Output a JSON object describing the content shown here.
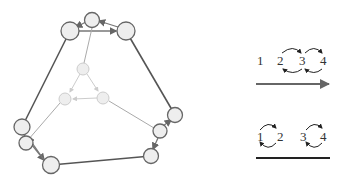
{
  "graph": {
    "description": "Truncated-tetrahedron-like graph with outer hexagon and inner faded triangle",
    "colors": {
      "outer_edge": "#555555",
      "inner_edge": "#aaaaaa",
      "faded_edge": "#cccccc",
      "node_fill": "#eeeeee",
      "node_stroke_outer": "#666666",
      "node_stroke_inner": "#cccccc"
    },
    "nodes": [
      {
        "id": "top",
        "x": 92,
        "y": 20,
        "r": 8,
        "layer": "outer"
      },
      {
        "id": "top-left",
        "x": 70,
        "y": 31,
        "r": 9,
        "layer": "outer"
      },
      {
        "id": "top-right",
        "x": 126,
        "y": 31,
        "r": 9,
        "layer": "outer"
      },
      {
        "id": "left",
        "x": 22,
        "y": 127,
        "r": 8,
        "layer": "outer"
      },
      {
        "id": "left-low",
        "x": 26,
        "y": 143,
        "r": 7,
        "layer": "outer"
      },
      {
        "id": "bottom-left",
        "x": 51,
        "y": 165,
        "r": 9,
        "layer": "outer"
      },
      {
        "id": "right",
        "x": 175,
        "y": 115,
        "r": 8,
        "layer": "outer"
      },
      {
        "id": "right-low",
        "x": 160,
        "y": 131,
        "r": 7,
        "layer": "outer"
      },
      {
        "id": "bottom-right",
        "x": 151,
        "y": 156,
        "r": 8,
        "layer": "outer"
      },
      {
        "id": "inner-top",
        "x": 83,
        "y": 69,
        "r": 6,
        "layer": "inner"
      },
      {
        "id": "inner-left",
        "x": 65,
        "y": 99,
        "r": 6,
        "layer": "inner"
      },
      {
        "id": "inner-right",
        "x": 103,
        "y": 98,
        "r": 6,
        "layer": "inner"
      }
    ]
  },
  "legend": {
    "top": {
      "labels": [
        "1",
        "2",
        "3",
        "4"
      ],
      "arrow": "right-arrow"
    },
    "bottom": {
      "labels": [
        "1",
        "2",
        "3",
        "4"
      ],
      "line": "plain-line"
    }
  }
}
